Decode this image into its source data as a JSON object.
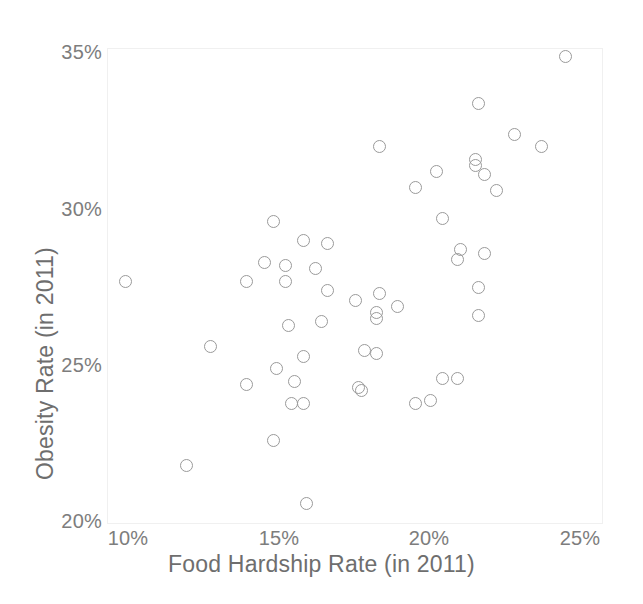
{
  "chart_data": {
    "type": "scatter",
    "title": "",
    "xlabel": "Food Hardship Rate (in 2011)",
    "ylabel": "Obesity Rate (in 2011)",
    "xlim": [
      9.3,
      25.3
    ],
    "ylim": [
      19.8,
      35.3
    ],
    "grid": false,
    "legend": null,
    "xtick_labels": [
      "10%",
      "15%",
      "20%",
      "25%"
    ],
    "xtick_values": [
      10,
      15,
      20,
      25
    ],
    "ytick_labels": [
      "20%",
      "25%",
      "30%",
      "35%"
    ],
    "ytick_values": [
      20,
      25,
      30,
      35
    ],
    "marker": "open-circle",
    "marker_color": "#9a9a9a",
    "series": [
      {
        "name": "States",
        "points": [
          {
            "x": 24.5,
            "y": 34.9
          },
          {
            "x": 21.6,
            "y": 33.4
          },
          {
            "x": 22.8,
            "y": 32.4
          },
          {
            "x": 23.7,
            "y": 32.0
          },
          {
            "x": 18.3,
            "y": 32.0
          },
          {
            "x": 21.5,
            "y": 31.6
          },
          {
            "x": 21.5,
            "y": 31.4
          },
          {
            "x": 20.2,
            "y": 31.2
          },
          {
            "x": 21.8,
            "y": 31.1
          },
          {
            "x": 19.5,
            "y": 30.7
          },
          {
            "x": 22.2,
            "y": 30.6
          },
          {
            "x": 20.4,
            "y": 29.7
          },
          {
            "x": 14.8,
            "y": 29.6
          },
          {
            "x": 15.8,
            "y": 29.0
          },
          {
            "x": 16.6,
            "y": 28.9
          },
          {
            "x": 21.0,
            "y": 28.7
          },
          {
            "x": 21.8,
            "y": 28.6
          },
          {
            "x": 20.9,
            "y": 28.4
          },
          {
            "x": 14.5,
            "y": 28.3
          },
          {
            "x": 15.2,
            "y": 28.2
          },
          {
            "x": 16.2,
            "y": 28.1
          },
          {
            "x": 15.2,
            "y": 27.7
          },
          {
            "x": 13.9,
            "y": 27.7
          },
          {
            "x": 9.9,
            "y": 27.7
          },
          {
            "x": 21.6,
            "y": 27.5
          },
          {
            "x": 16.6,
            "y": 27.4
          },
          {
            "x": 18.3,
            "y": 27.3
          },
          {
            "x": 17.5,
            "y": 27.1
          },
          {
            "x": 18.9,
            "y": 26.9
          },
          {
            "x": 18.2,
            "y": 26.7
          },
          {
            "x": 18.2,
            "y": 26.5
          },
          {
            "x": 21.6,
            "y": 26.6
          },
          {
            "x": 16.4,
            "y": 26.4
          },
          {
            "x": 15.3,
            "y": 26.3
          },
          {
            "x": 12.7,
            "y": 25.6
          },
          {
            "x": 17.8,
            "y": 25.5
          },
          {
            "x": 18.2,
            "y": 25.4
          },
          {
            "x": 15.8,
            "y": 25.3
          },
          {
            "x": 14.9,
            "y": 24.9
          },
          {
            "x": 20.4,
            "y": 24.6
          },
          {
            "x": 20.9,
            "y": 24.6
          },
          {
            "x": 15.5,
            "y": 24.5
          },
          {
            "x": 13.9,
            "y": 24.4
          },
          {
            "x": 17.6,
            "y": 24.3
          },
          {
            "x": 17.7,
            "y": 24.2
          },
          {
            "x": 20.0,
            "y": 23.9
          },
          {
            "x": 19.5,
            "y": 23.8
          },
          {
            "x": 15.4,
            "y": 23.8
          },
          {
            "x": 15.8,
            "y": 23.8
          },
          {
            "x": 14.8,
            "y": 22.6
          },
          {
            "x": 11.9,
            "y": 21.8
          },
          {
            "x": 15.9,
            "y": 20.6
          }
        ]
      }
    ]
  }
}
